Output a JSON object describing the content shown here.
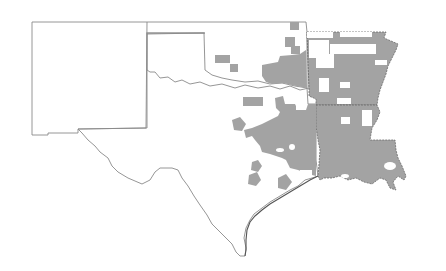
{
  "map": {
    "type": "choropleth",
    "region": "South Central United States",
    "states": [
      "New Mexico",
      "Oklahoma",
      "Texas",
      "Arkansas",
      "Louisiana"
    ],
    "colors": {
      "background": "#ffffff",
      "boundary": "#8a8a8a",
      "shaded_county": "#a3a3a3"
    },
    "legend": null,
    "title": ""
  }
}
